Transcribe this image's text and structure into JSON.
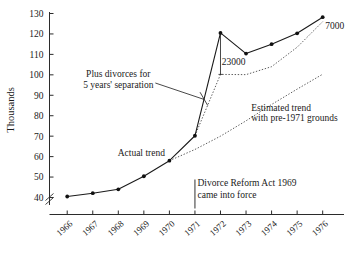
{
  "chart_data": {
    "type": "line",
    "title": "",
    "xlabel": "",
    "ylabel": "Thousands",
    "x": [
      1966,
      1967,
      1968,
      1969,
      1970,
      1971,
      1972,
      1973,
      1974,
      1975,
      1976
    ],
    "categories": [
      "1966",
      "1967",
      "1968",
      "1969",
      "1970",
      "1971",
      "1972",
      "1973",
      "1974",
      "1975",
      "1976"
    ],
    "ylim": [
      36,
      130
    ],
    "xlim": [
      1965.6,
      1976.6
    ],
    "yticks": [
      40,
      50,
      60,
      70,
      80,
      90,
      100,
      110,
      120,
      130
    ],
    "ytick_labels": [
      "40",
      "50",
      "60",
      "70",
      "80",
      "90",
      "100",
      "110",
      "120",
      "130"
    ],
    "axis_break": true,
    "axis_break_note": "y-axis broken below 40",
    "grid": false,
    "legend": "none (inline annotations)",
    "series": [
      {
        "name": "Actual trend",
        "style": "solid-with-markers",
        "x": [
          1966,
          1967,
          1968,
          1969,
          1970,
          1971,
          1972,
          1973,
          1974,
          1975,
          1976
        ],
        "values": [
          40.5,
          42.1,
          44.0,
          50.4,
          58.0,
          70.2,
          120.5,
          110.4,
          115.0,
          120.3,
          128.2
        ]
      },
      {
        "name": "Plus divorces for 5 years' separation",
        "style": "dotted",
        "x": [
          1971,
          1972,
          1973,
          1974,
          1975,
          1976
        ],
        "values": [
          70.2,
          100.2,
          100.1,
          104.0,
          113.5,
          126.0
        ]
      },
      {
        "name": "Estimated trend with pre-1971 grounds",
        "style": "dotted",
        "x": [
          1970,
          1971,
          1972,
          1973,
          1974,
          1975,
          1976
        ],
        "values": [
          58.0,
          63.5,
          70.0,
          77.5,
          85.5,
          93.0,
          100.3
        ]
      }
    ],
    "annotations": [
      {
        "name": "actual-trend",
        "text": "Actual trend",
        "x": 1968.9,
        "y": 60.5
      },
      {
        "name": "plus-divorces",
        "line1": "Plus divorces for",
        "line2": "5 years' separation",
        "x": 1968.0,
        "y": 99.0
      },
      {
        "name": "estimated-trend",
        "line1": "Estimated trend",
        "line2": "with pre-1971 grounds",
        "x": 1973.2,
        "y": 82.5
      },
      {
        "name": "event",
        "line1": "Divorce Reform Act 1969",
        "line2": "came into force",
        "x": 1971.1,
        "y": 45.5
      },
      {
        "name": "gap-1972",
        "text": "23000",
        "x": 1972.05,
        "y": 105.0
      },
      {
        "name": "gap-1976",
        "text": "7000",
        "x": 1976.1,
        "y": 122.5
      }
    ]
  },
  "axis": {
    "y_title": "Thousands"
  }
}
